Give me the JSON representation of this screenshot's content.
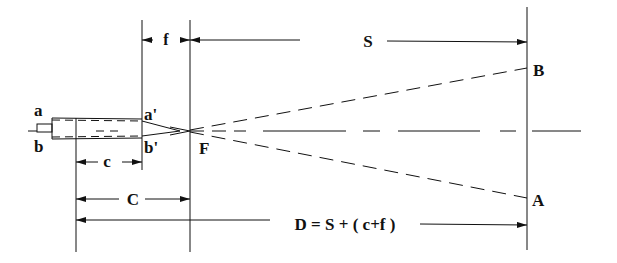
{
  "diagram": {
    "type": "optical projection geometry",
    "colors": {
      "line": "#111111",
      "background": "#ffffff"
    },
    "points": {
      "a": "a",
      "b": "b",
      "a_prime": "a'",
      "b_prime": "b'",
      "F": "F",
      "B": "B",
      "A": "A"
    },
    "dimensions": {
      "f": "f",
      "S": "S",
      "c": "c",
      "C": "C",
      "D": "D = S + ( c+f )"
    }
  }
}
